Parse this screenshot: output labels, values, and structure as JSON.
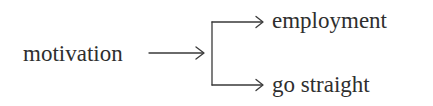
{
  "diagram": {
    "type": "flow",
    "source": {
      "label": "motivation"
    },
    "targets": [
      {
        "label": "employment"
      },
      {
        "label": "go straight"
      }
    ],
    "edges": [
      {
        "from": "motivation",
        "to": "branch"
      },
      {
        "from": "branch",
        "to": "employment"
      },
      {
        "from": "branch",
        "to": "go straight"
      }
    ],
    "colors": {
      "text": "#2e2e2e",
      "line": "#3a3a3a",
      "background": "#ffffff"
    }
  }
}
